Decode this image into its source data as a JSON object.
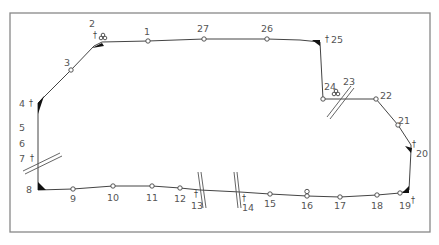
{
  "diagram": {
    "type": "route-schematic",
    "frame": {
      "x": 10,
      "y": 13,
      "width": 420,
      "height": 219,
      "stroke": "#888888"
    },
    "stations": [
      {
        "id": "1",
        "label": "1",
        "x": 148,
        "y": 41
      },
      {
        "id": "2",
        "label": "2",
        "x": 102,
        "y": 42,
        "marker": "cross",
        "extra": "junction-symbol"
      },
      {
        "id": "3",
        "label": "3",
        "x": 71,
        "y": 70
      },
      {
        "id": "4",
        "label": "4",
        "x": 38,
        "y": 103,
        "marker": "cross"
      },
      {
        "id": "5",
        "label": "5"
      },
      {
        "id": "6",
        "label": "6"
      },
      {
        "id": "7",
        "label": "7",
        "marker": "cross"
      },
      {
        "id": "8",
        "label": "8",
        "x": 38,
        "y": 190
      },
      {
        "id": "9",
        "label": "9",
        "x": 73,
        "y": 189
      },
      {
        "id": "10",
        "label": "10",
        "x": 113,
        "y": 186
      },
      {
        "id": "11",
        "label": "11",
        "x": 152,
        "y": 186
      },
      {
        "id": "12",
        "label": "12",
        "x": 180,
        "y": 188
      },
      {
        "id": "13",
        "label": "13",
        "marker": "cross"
      },
      {
        "id": "14",
        "label": "14",
        "marker": "cross"
      },
      {
        "id": "15",
        "label": "15",
        "x": 270,
        "y": 194
      },
      {
        "id": "16",
        "label": "16",
        "x": 307,
        "y": 196,
        "extra": "double-node"
      },
      {
        "id": "17",
        "label": "17",
        "x": 340,
        "y": 197
      },
      {
        "id": "18",
        "label": "18",
        "x": 377,
        "y": 195
      },
      {
        "id": "19",
        "label": "19",
        "x": 400,
        "y": 193,
        "marker": "cross"
      },
      {
        "id": "20",
        "label": "20",
        "x": 411,
        "y": 150,
        "marker": "cross"
      },
      {
        "id": "21",
        "label": "21",
        "x": 398,
        "y": 125
      },
      {
        "id": "22",
        "label": "22",
        "x": 376,
        "y": 99
      },
      {
        "id": "23",
        "label": "23"
      },
      {
        "id": "24",
        "label": "24",
        "x": 323,
        "y": 99,
        "extra": "junction-symbol"
      },
      {
        "id": "25",
        "label": "25",
        "x": 320,
        "y": 42,
        "marker": "cross"
      },
      {
        "id": "26",
        "label": "26",
        "x": 267,
        "y": 39
      },
      {
        "id": "27",
        "label": "27",
        "x": 204,
        "y": 39
      }
    ],
    "breaks": [
      {
        "between": "7-8",
        "label": "7"
      },
      {
        "between": "12-15",
        "label": "13"
      },
      {
        "between": "12-15",
        "label": "14"
      },
      {
        "between": "24-22",
        "label": "23"
      }
    ],
    "colors": {
      "line": "#444444",
      "label": "#555555",
      "terminal": "#111111"
    }
  }
}
